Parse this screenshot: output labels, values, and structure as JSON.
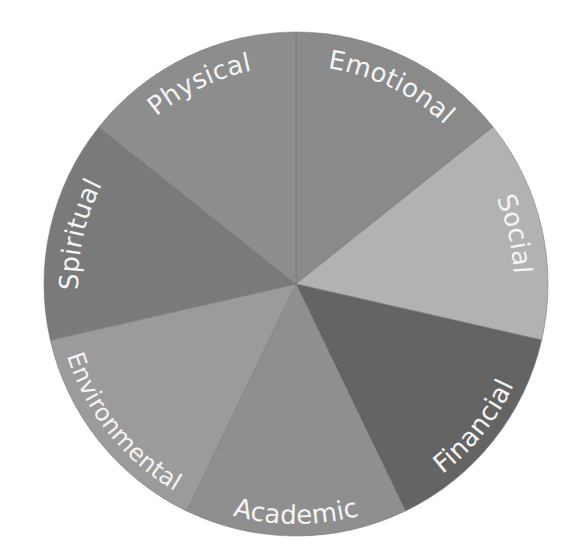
{
  "chart_data": {
    "type": "pie",
    "title": "",
    "center": [
      296,
      284
    ],
    "radius": 252,
    "start_angle_deg": -90,
    "categories": [
      "Emotional",
      "Social",
      "Financial",
      "Academic",
      "Environmental",
      "Spiritual",
      "Physical"
    ],
    "values": [
      1,
      1,
      1,
      1,
      1,
      1,
      1
    ],
    "colors": [
      "#8a8a8a",
      "#b2b2b2",
      "#646464",
      "#8f8f8f",
      "#9b9b9b",
      "#7a7a7a",
      "#8d8d8d"
    ],
    "label_placement": "curved along outer edge, inside slice",
    "label_color": "#f4f4f4",
    "legend": "none",
    "grid": false
  }
}
